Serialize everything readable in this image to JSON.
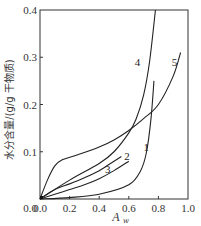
{
  "chart_data": {
    "type": "line",
    "title": "",
    "xlabel": "A_w",
    "ylabel": "水分含量/(g/g 干物质)",
    "xlim": [
      0.0,
      1.0
    ],
    "ylim": [
      0.0,
      0.4
    ],
    "xticks": [
      "0.0",
      "0.2",
      "0.4",
      "0.6",
      "0.8",
      "1.0"
    ],
    "yticks": [
      "0.0",
      "0.1",
      "0.2",
      "0.3",
      "0.4"
    ],
    "grid": false,
    "legend": "inline curve labels 1-5",
    "series": [
      {
        "name": "1",
        "x": [
          0.0,
          0.2,
          0.4,
          0.6,
          0.68,
          0.72,
          0.75,
          0.77
        ],
        "y": [
          0.0,
          0.003,
          0.01,
          0.03,
          0.06,
          0.1,
          0.17,
          0.25
        ]
      },
      {
        "name": "2",
        "x": [
          0.0,
          0.1,
          0.2,
          0.3,
          0.4,
          0.5,
          0.55
        ],
        "y": [
          0.0,
          0.02,
          0.032,
          0.045,
          0.06,
          0.08,
          0.09
        ]
      },
      {
        "name": "3",
        "x": [
          0.0,
          0.1,
          0.2,
          0.3,
          0.4,
          0.5,
          0.6
        ],
        "y": [
          0.0,
          0.01,
          0.02,
          0.03,
          0.043,
          0.06,
          0.08
        ]
      },
      {
        "name": "4",
        "x": [
          0.0,
          0.2,
          0.4,
          0.5,
          0.6,
          0.65,
          0.7,
          0.74,
          0.78
        ],
        "y": [
          0.0,
          0.04,
          0.075,
          0.1,
          0.14,
          0.17,
          0.22,
          0.29,
          0.4
        ]
      },
      {
        "name": "5",
        "x": [
          0.0,
          0.05,
          0.1,
          0.15,
          0.25,
          0.4,
          0.5,
          0.6,
          0.7,
          0.8,
          0.9,
          0.95
        ],
        "y": [
          0.0,
          0.04,
          0.07,
          0.083,
          0.093,
          0.11,
          0.125,
          0.145,
          0.17,
          0.2,
          0.26,
          0.31
        ]
      }
    ]
  }
}
